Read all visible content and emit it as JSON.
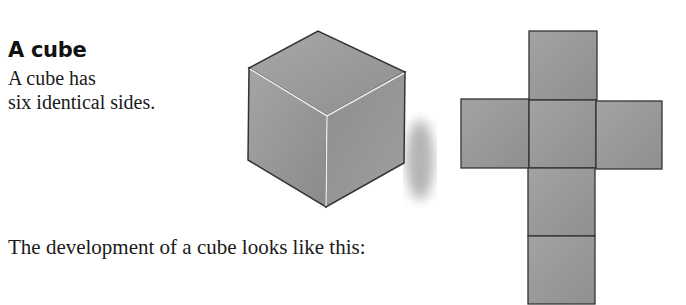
{
  "section": {
    "heading": "A cube",
    "intro_line1": "A cube has",
    "intro_line2": "six identical sides.",
    "caption": "The development of a cube looks like this:"
  },
  "figures": {
    "cube": {
      "label": "cube-illustration",
      "faces": 3
    },
    "net": {
      "label": "cube-net",
      "faces": 6,
      "layout": "cross"
    }
  },
  "colors": {
    "face": "#9a9a9a",
    "edge": "#333333",
    "highlight": "#f0f0f0"
  }
}
